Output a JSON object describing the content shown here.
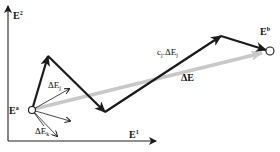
{
  "diagram": {
    "axes": {
      "y_label": {
        "base": "E",
        "sup": "2"
      },
      "x_label": {
        "base": "E",
        "sup": "1"
      }
    },
    "points": {
      "start": {
        "base": "E",
        "sup": "a"
      },
      "end": {
        "base": "E",
        "sup": "b"
      }
    },
    "vectors": {
      "total": {
        "label": "ΔE"
      },
      "step": {
        "prefix": "c",
        "prefix_sub": "j",
        "middle": ".ΔE",
        "sub": "j"
      },
      "dej": {
        "base": "ΔE",
        "sub": "j"
      },
      "dek": {
        "base": "ΔE",
        "sub": "k"
      }
    },
    "colors": {
      "path": "#1a1a1a",
      "total_vector": "#c8c8c8",
      "axis": "#222222"
    }
  }
}
